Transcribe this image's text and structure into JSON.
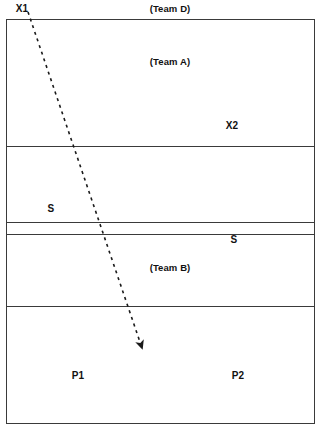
{
  "diagram": {
    "canvas": {
      "width": 321,
      "height": 437
    },
    "colors": {
      "line": "#3a3a3a",
      "text": "#111111",
      "background": "#ffffff",
      "trajectory": "#1a1a1a"
    },
    "field": {
      "x": 6,
      "y": 19,
      "width": 309,
      "height": 405
    },
    "dividers": [
      {
        "name": "divider-1",
        "y": 146
      },
      {
        "name": "divider-2",
        "y": 222
      },
      {
        "name": "divider-3",
        "y": 234
      },
      {
        "name": "divider-4",
        "y": 306
      }
    ],
    "labels": [
      {
        "id": "team-d",
        "text": "(Team D)",
        "x": 170,
        "y": 9,
        "kind": "team"
      },
      {
        "id": "x1",
        "text": "X1",
        "x": 22,
        "y": 9,
        "kind": "marker"
      },
      {
        "id": "team-a",
        "text": "(Team A)",
        "x": 170,
        "y": 62,
        "kind": "team"
      },
      {
        "id": "x2",
        "text": "X2",
        "x": 232,
        "y": 126,
        "kind": "marker"
      },
      {
        "id": "s-left",
        "text": "S",
        "x": 51,
        "y": 209,
        "kind": "marker"
      },
      {
        "id": "s-right",
        "text": "S",
        "x": 234,
        "y": 240,
        "kind": "marker"
      },
      {
        "id": "team-b",
        "text": "(Team B)",
        "x": 170,
        "y": 268,
        "kind": "team"
      },
      {
        "id": "p1",
        "text": "P1",
        "x": 78,
        "y": 376,
        "kind": "marker"
      },
      {
        "id": "p2",
        "text": "P2",
        "x": 238,
        "y": 376,
        "kind": "marker"
      }
    ],
    "trajectory": {
      "name": "dashed-arrow-path",
      "style": "dashed",
      "start": {
        "x": 28,
        "y": 12
      },
      "end": {
        "x": 141,
        "y": 345
      },
      "arrowhead": "end",
      "dash_pattern": "3 4",
      "stroke_width": 1.6
    }
  }
}
